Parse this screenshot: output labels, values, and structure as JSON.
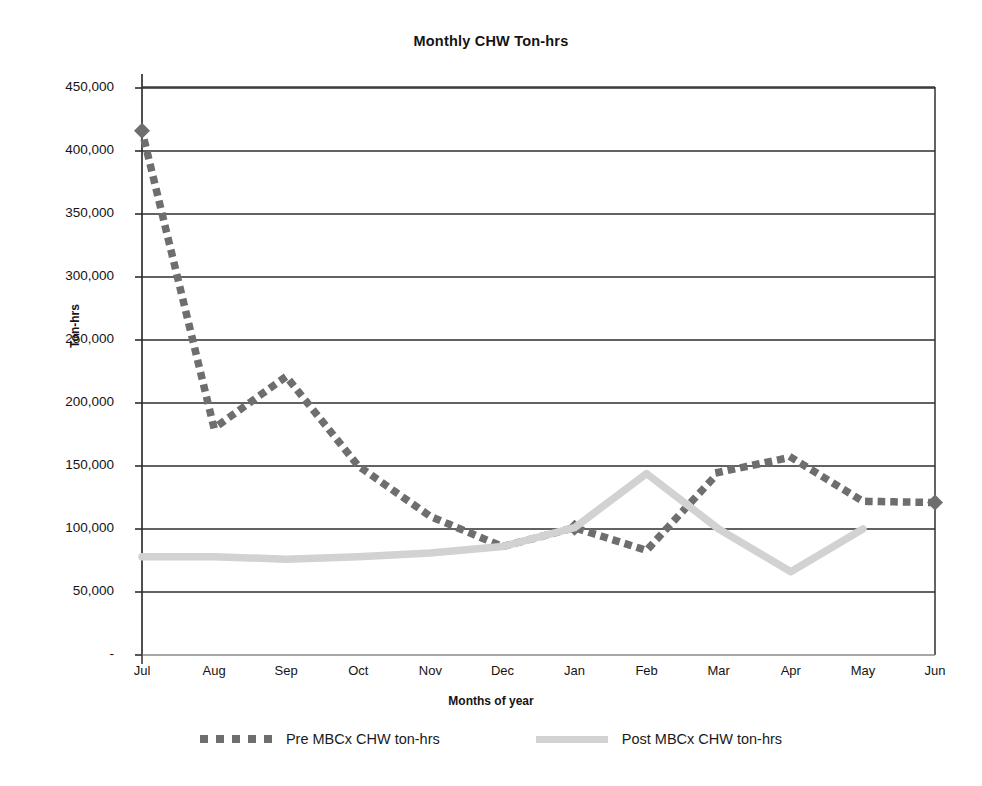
{
  "chart_data": {
    "type": "line",
    "title": "Monthly CHW Ton-hrs",
    "xlabel": "Months of year",
    "ylabel": "Ton-hrs",
    "categories": [
      "Jul",
      "Aug",
      "Sep",
      "Oct",
      "Nov",
      "Dec",
      "Jan",
      "Feb",
      "Mar",
      "Apr",
      "May",
      "Jun"
    ],
    "ylim": [
      0,
      450000
    ],
    "ytick_labels": [
      "-",
      "50,000",
      "100,000",
      "150,000",
      "200,000",
      "250,000",
      "300,000",
      "350,000",
      "400,000",
      "450,000"
    ],
    "ytick_values": [
      0,
      50000,
      100000,
      150000,
      200000,
      250000,
      300000,
      350000,
      400000,
      450000
    ],
    "grid": "horizontal",
    "legend_position": "bottom",
    "series": [
      {
        "name": "Pre MBCx CHW ton-hrs",
        "style": "dotted",
        "color": "#6e6e6e",
        "values": [
          416000,
          180000,
          221000,
          150000,
          110000,
          86000,
          101000,
          83000,
          145000,
          157000,
          122000,
          121000
        ]
      },
      {
        "name": "Post MBCx CHW ton-hrs",
        "style": "solid",
        "color": "#d2d2d2",
        "values": [
          78000,
          78000,
          76000,
          78000,
          81000,
          86000,
          101000,
          144000,
          100000,
          66000,
          100000,
          null
        ]
      }
    ]
  },
  "axis": {
    "y_title": "Ton-hrs",
    "x_title": "Months of year"
  },
  "legend": {
    "items": [
      {
        "label": "Pre MBCx CHW ton-hrs",
        "marker": "dotted-line-swatch"
      },
      {
        "label": "Post MBCx CHW ton-hrs",
        "marker": "solid-line-swatch"
      }
    ]
  }
}
